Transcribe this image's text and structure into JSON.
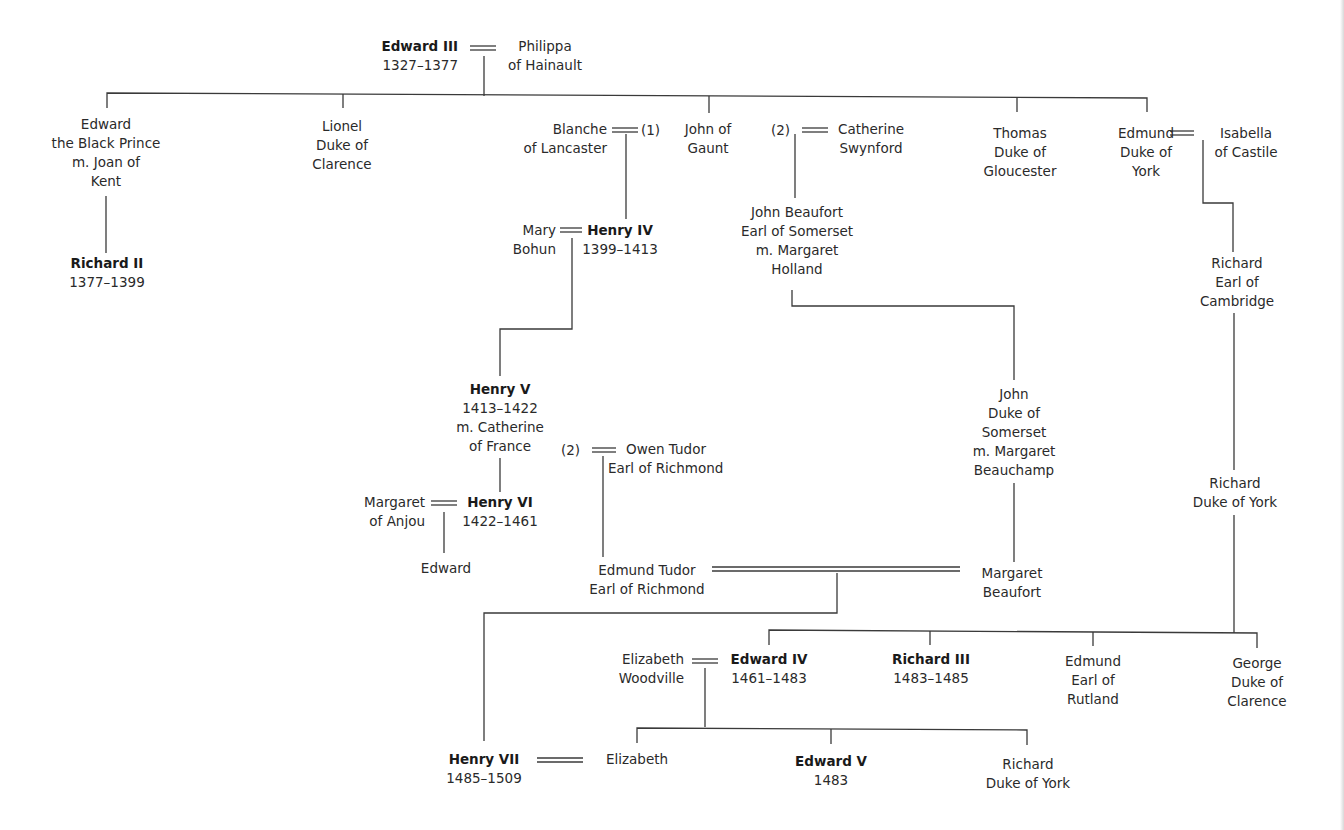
{
  "diagram": {
    "type": "family-tree",
    "nodes": {
      "edward_iii": {
        "lines": [
          "Edward III",
          "1327–1377"
        ],
        "bold_first": true
      },
      "philippa": {
        "lines": [
          "Philippa",
          "of Hainault"
        ]
      },
      "black_prince": {
        "lines": [
          "Edward",
          "the Black Prince",
          "m. Joan of",
          "Kent"
        ]
      },
      "lionel": {
        "lines": [
          "Lionel",
          "Duke of",
          "Clarence"
        ]
      },
      "blanche": {
        "lines": [
          "Blanche",
          "of Lancaster"
        ]
      },
      "john_of_gaunt": {
        "lines": [
          "John of",
          "Gaunt"
        ]
      },
      "catherine_swynford": {
        "lines": [
          "Catherine",
          "Swynford"
        ]
      },
      "thomas": {
        "lines": [
          "Thomas",
          "Duke of",
          "Gloucester"
        ]
      },
      "edmund_york": {
        "lines": [
          "Edmund",
          "Duke of",
          "York"
        ]
      },
      "isabella": {
        "lines": [
          "Isabella",
          "of Castile"
        ]
      },
      "richard_ii": {
        "lines": [
          "Richard II",
          "1377–1399"
        ],
        "bold_first": true
      },
      "mary_bohun": {
        "lines": [
          "Mary",
          "Bohun"
        ]
      },
      "henry_iv": {
        "lines": [
          "Henry IV",
          "1399–1413"
        ],
        "bold_first": true
      },
      "john_beaufort": {
        "lines": [
          "John Beaufort",
          "Earl of Somerset",
          "m. Margaret",
          "Holland"
        ]
      },
      "richard_cambridge": {
        "lines": [
          "Richard",
          "Earl of",
          "Cambridge"
        ]
      },
      "henry_v": {
        "lines": [
          "Henry V",
          "1413–1422",
          "m. Catherine",
          "of France"
        ],
        "bold_first": true
      },
      "owen_tudor": {
        "lines": [
          "Owen Tudor",
          "Earl of Richmond"
        ]
      },
      "john_somerset": {
        "lines": [
          "John",
          "Duke of",
          "Somerset",
          "m. Margaret",
          "Beauchamp"
        ]
      },
      "richard_york": {
        "lines": [
          "Richard",
          "Duke of York"
        ]
      },
      "margaret_anjou": {
        "lines": [
          "Margaret",
          "of Anjou"
        ]
      },
      "henry_vi": {
        "lines": [
          "Henry VI",
          "1422–1461"
        ],
        "bold_first": true
      },
      "edward_son_henry_vi": {
        "lines": [
          "Edward"
        ]
      },
      "edmund_tudor": {
        "lines": [
          "Edmund Tudor",
          "Earl of Richmond"
        ]
      },
      "margaret_beaufort": {
        "lines": [
          "Margaret",
          "Beaufort"
        ]
      },
      "elizabeth_woodville": {
        "lines": [
          "Elizabeth",
          "Woodville"
        ]
      },
      "edward_iv": {
        "lines": [
          "Edward IV",
          "1461–1483"
        ],
        "bold_first": true
      },
      "richard_iii": {
        "lines": [
          "Richard III",
          "1483–1485"
        ],
        "bold_first": true
      },
      "edmund_rutland": {
        "lines": [
          "Edmund",
          "Earl of",
          "Rutland"
        ]
      },
      "george_clarence": {
        "lines": [
          "George",
          "Duke of",
          "Clarence"
        ]
      },
      "henry_vii": {
        "lines": [
          "Henry VII",
          "1485–1509"
        ],
        "bold_first": true
      },
      "elizabeth_york": {
        "lines": [
          "Elizabeth"
        ]
      },
      "edward_v": {
        "lines": [
          "Edward V",
          "1483"
        ],
        "bold_first": true
      },
      "richard_duke_york_younger": {
        "lines": [
          "Richard",
          "Duke of York"
        ]
      }
    },
    "marriage_markers": {
      "gaunt_first": "(1)",
      "gaunt_second": "(2)",
      "catherine_second": "(2)"
    },
    "marriages": [
      [
        "edward_iii",
        "philippa"
      ],
      [
        "blanche",
        "john_of_gaunt"
      ],
      [
        "john_of_gaunt",
        "catherine_swynford"
      ],
      [
        "edmund_york",
        "isabella"
      ],
      [
        "mary_bohun",
        "henry_iv"
      ],
      [
        "henry_v",
        "owen_tudor"
      ],
      [
        "margaret_anjou",
        "henry_vi"
      ],
      [
        "edmund_tudor",
        "margaret_beaufort"
      ],
      [
        "elizabeth_woodville",
        "edward_iv"
      ],
      [
        "henry_vii",
        "elizabeth_york"
      ]
    ],
    "descents": [
      [
        "edward_iii",
        "black_prince"
      ],
      [
        "edward_iii",
        "lionel"
      ],
      [
        "edward_iii",
        "john_of_gaunt"
      ],
      [
        "edward_iii",
        "thomas"
      ],
      [
        "edward_iii",
        "edmund_york"
      ],
      [
        "black_prince",
        "richard_ii"
      ],
      [
        "john_of_gaunt",
        "henry_iv"
      ],
      [
        "john_of_gaunt",
        "john_beaufort"
      ],
      [
        "edmund_york",
        "richard_cambridge"
      ],
      [
        "henry_iv",
        "henry_v"
      ],
      [
        "john_beaufort",
        "john_somerset"
      ],
      [
        "richard_cambridge",
        "richard_york"
      ],
      [
        "henry_v",
        "henry_vi"
      ],
      [
        "owen_tudor",
        "edmund_tudor"
      ],
      [
        "henry_vi",
        "edward_son_henry_vi"
      ],
      [
        "john_somerset",
        "margaret_beaufort"
      ],
      [
        "edmund_tudor",
        "henry_vii"
      ],
      [
        "richard_york",
        "edward_iv"
      ],
      [
        "richard_york",
        "richard_iii"
      ],
      [
        "richard_york",
        "edmund_rutland"
      ],
      [
        "richard_york",
        "george_clarence"
      ],
      [
        "edward_iv",
        "elizabeth_york"
      ],
      [
        "edward_iv",
        "edward_v"
      ],
      [
        "edward_iv",
        "richard_duke_york_younger"
      ]
    ]
  }
}
